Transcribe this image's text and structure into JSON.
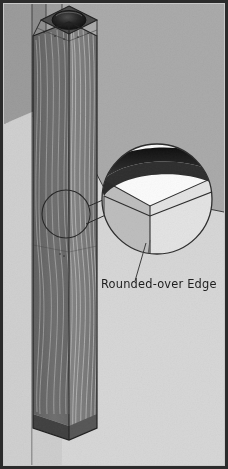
{
  "figure": {
    "kind": "technical-illustration",
    "width": 228,
    "height": 469,
    "annotations": [
      {
        "name": "rounded-over-edge",
        "text": "Rounded-over Edge"
      }
    ],
    "parts": {
      "wall_back_label": "Back wall",
      "wall_side_label": "Side wall",
      "floor_label": "Floor",
      "post_label": "Wooden post",
      "post_top_label": "Post top cap",
      "detail_circle_label": "Detail callout circle",
      "magnifier_label": "Magnified corner detail"
    },
    "colors": {
      "frame": "#2b2b2b",
      "paper": "#c9c9c9",
      "wall_back": "#a9a9a9",
      "wall_side": "#9a9a9a",
      "wall_side_dark": "#8a8a8a",
      "floor": "#d6d6d6",
      "floor_shadow": "#c4c4c4",
      "post_left_face": "#6c6c6c",
      "post_right_face": "#7b7b7b",
      "post_top_face": "#4a4a4a",
      "post_top_round": "#171717",
      "grain": "#d8d8d8",
      "outline": "#262626",
      "magnifier_fill": "#fbfbfb",
      "magnifier_edge_dark": "#181818",
      "magnifier_side_light": "#e2e2e2",
      "magnifier_side_gray": "#bdbdbd",
      "leader_line": "#3a3a3a",
      "label_text": "#1a1a1a"
    }
  }
}
